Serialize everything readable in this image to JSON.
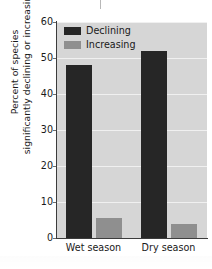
{
  "chart_data": {
    "type": "bar",
    "title": "",
    "xlabel": "",
    "ylabel": "Percent of species significantly declining or increasing",
    "ylabel_line1": "Percent of species",
    "ylabel_line2": "significantly declining or increasing",
    "categories": [
      "Wet season",
      "Dry season"
    ],
    "series": [
      {
        "name": "Declining",
        "color": "#262626",
        "values": [
          48,
          52
        ]
      },
      {
        "name": "Increasing",
        "color": "#8f8f8f",
        "values": [
          5.5,
          4
        ]
      }
    ],
    "ylim": [
      0,
      60
    ],
    "ytick_labels": [
      "0",
      "10",
      "20",
      "30",
      "40",
      "50",
      "60"
    ],
    "ytick_values": [
      0,
      10,
      20,
      30,
      40,
      50,
      60
    ],
    "grid": true,
    "legend_position": "top-left",
    "plot_background": "#d6d6d6",
    "gridline_color": "#f0f0f0",
    "axis_color": "#3c3c3c"
  },
  "legend": {
    "entries": [
      {
        "label": "Declining",
        "swatch": "declining"
      },
      {
        "label": "Increasing",
        "swatch": "increasing"
      }
    ]
  }
}
